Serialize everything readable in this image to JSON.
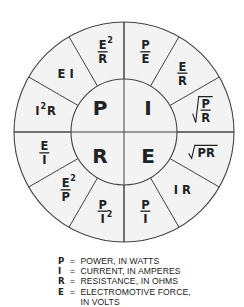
{
  "diagram": {
    "center": {
      "x": 124,
      "y": 132
    },
    "outer_radius": 110,
    "inner_radius": 53,
    "colors": {
      "fill": "#f3f3f3",
      "stroke": "#444444",
      "text": "#222222"
    },
    "quadrants": [
      {
        "symbol": "P",
        "position": "top-left"
      },
      {
        "symbol": "I",
        "position": "top-right"
      },
      {
        "symbol": "R",
        "position": "bottom-left"
      },
      {
        "symbol": "E",
        "position": "bottom-right"
      }
    ],
    "formulas": [
      {
        "id": "E2/R",
        "quantity": "P",
        "num": "E",
        "num_sup": "2",
        "den": "R",
        "type": "fraction",
        "angle": 105
      },
      {
        "id": "EI",
        "quantity": "P",
        "text": "E I",
        "type": "plain",
        "angle": 135
      },
      {
        "id": "I2R",
        "quantity": "P",
        "text": "I",
        "sup": "2",
        "after": "R",
        "type": "power",
        "angle": 165
      },
      {
        "id": "E/I",
        "quantity": "R",
        "num": "E",
        "den": "I",
        "type": "fraction",
        "angle": 195
      },
      {
        "id": "E2/P",
        "quantity": "R",
        "num": "E",
        "num_sup": "2",
        "den": "P",
        "type": "fraction",
        "angle": 225
      },
      {
        "id": "P/I2",
        "quantity": "R",
        "num": "P",
        "den": "I",
        "den_sup": "2",
        "type": "fraction",
        "angle": 255
      },
      {
        "id": "P/I",
        "quantity": "E",
        "num": "P",
        "den": "I",
        "type": "fraction",
        "angle": 285
      },
      {
        "id": "IR",
        "quantity": "E",
        "text": "I R",
        "type": "plain",
        "angle": 315
      },
      {
        "id": "sqrtPR",
        "quantity": "E",
        "text": "PR",
        "type": "sqrt",
        "angle": 345
      },
      {
        "id": "sqrtP/R",
        "quantity": "I",
        "num": "P",
        "den": "R",
        "type": "sqrtfrac",
        "angle": 15
      },
      {
        "id": "E/R",
        "quantity": "I",
        "num": "E",
        "den": "R",
        "type": "fraction",
        "angle": 45
      },
      {
        "id": "P/E",
        "quantity": "I",
        "num": "P",
        "den": "E",
        "type": "fraction",
        "angle": 75
      }
    ]
  },
  "legend": [
    {
      "symbol": "P",
      "eq": "=",
      "text": "POWER, IN WATTS"
    },
    {
      "symbol": "I",
      "eq": "=",
      "text": "CURRENT, IN AMPERES"
    },
    {
      "symbol": "R",
      "eq": "=",
      "text": "RESISTANCE, IN OHMS"
    },
    {
      "symbol": "E",
      "eq": "=",
      "text": "ELECTROMOTIVE FORCE,"
    },
    {
      "symbol": "",
      "eq": "",
      "text": "IN VOLTS"
    }
  ]
}
